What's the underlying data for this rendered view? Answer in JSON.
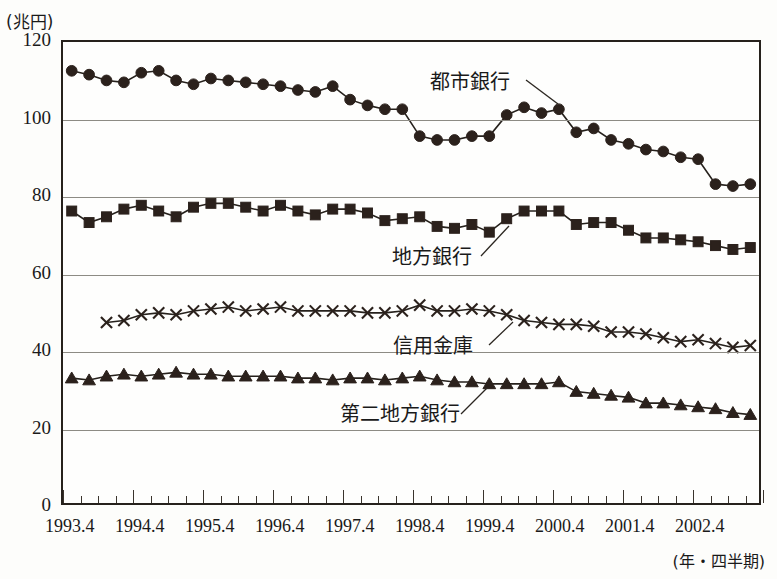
{
  "axes": {
    "y_unit_label": "(兆円)",
    "x_unit_label": "(年・四半期)",
    "y_ticks": [
      "0",
      "20",
      "40",
      "60",
      "80",
      "100",
      "120"
    ],
    "x_ticks": [
      "1993.4",
      "1994.4",
      "1995.4",
      "1996.4",
      "1997.4",
      "1998.4",
      "1999.4",
      "2000.4",
      "2001.4",
      "2002.4"
    ]
  },
  "annotations": {
    "city": "都市銀行",
    "regional": "地方銀行",
    "shinkin": "信用金庫",
    "second_regional": "第二地方銀行"
  },
  "colors": {
    "ink": "#26211c",
    "grid": "#8d8b84",
    "background": "#fdfdfb"
  },
  "chart_data": {
    "type": "line",
    "title": "",
    "xlabel": "(年・四半期)",
    "ylabel": "(兆円)",
    "ylim": [
      0,
      120
    ],
    "grid": true,
    "legend": "inline-annotations",
    "x": [
      "1993.4",
      "1993.7",
      "1993.10",
      "1994.1",
      "1994.4",
      "1994.7",
      "1994.10",
      "1995.1",
      "1995.4",
      "1995.7",
      "1995.10",
      "1996.1",
      "1996.4",
      "1996.7",
      "1996.10",
      "1997.1",
      "1997.4",
      "1997.7",
      "1997.10",
      "1998.1",
      "1998.4",
      "1998.7",
      "1998.10",
      "1999.1",
      "1999.4",
      "1999.7",
      "1999.10",
      "2000.1",
      "2000.4",
      "2000.7",
      "2000.10",
      "2001.1",
      "2001.4",
      "2001.7",
      "2001.10",
      "2002.1",
      "2002.4",
      "2002.7",
      "2002.10",
      "2003.1"
    ],
    "series": [
      {
        "name": "都市銀行",
        "marker": "circle",
        "values": [
          112.5,
          111.5,
          110.0,
          109.5,
          112.0,
          112.5,
          110.0,
          109.0,
          110.5,
          110.0,
          109.5,
          109.0,
          108.5,
          107.5,
          107.0,
          108.5,
          105.0,
          103.5,
          102.5,
          102.5,
          95.5,
          94.5,
          94.5,
          95.5,
          95.5,
          101.0,
          103.0,
          101.5,
          102.5,
          96.5,
          97.5,
          94.5,
          93.5,
          92.0,
          91.5,
          90.0,
          89.5,
          83.0,
          82.5,
          83.0
        ]
      },
      {
        "name": "地方銀行",
        "marker": "square",
        "values": [
          76.0,
          73.0,
          74.5,
          76.5,
          77.5,
          76.0,
          74.5,
          77.0,
          78.0,
          78.0,
          77.0,
          76.0,
          77.5,
          76.0,
          75.0,
          76.5,
          76.5,
          75.5,
          73.5,
          74.0,
          74.5,
          72.0,
          71.5,
          72.5,
          70.5,
          74.0,
          76.0,
          76.0,
          76.0,
          72.5,
          73.0,
          73.0,
          71.0,
          69.0,
          69.0,
          68.5,
          68.0,
          67.0,
          66.0,
          66.5
        ]
      },
      {
        "name": "信用金庫",
        "marker": "cross",
        "values": [
          null,
          null,
          47.0,
          47.5,
          49.0,
          49.5,
          49.0,
          50.0,
          50.5,
          51.0,
          50.0,
          50.5,
          51.0,
          50.0,
          50.0,
          50.0,
          50.0,
          49.5,
          49.5,
          50.0,
          51.5,
          50.0,
          50.0,
          50.5,
          50.0,
          49.0,
          47.5,
          47.0,
          46.5,
          46.5,
          46.0,
          44.5,
          44.5,
          44.0,
          43.0,
          42.0,
          42.5,
          41.5,
          40.5,
          41.0
        ]
      },
      {
        "name": "第二地方銀行",
        "marker": "triangle",
        "values": [
          32.5,
          32.0,
          33.0,
          33.5,
          33.0,
          33.5,
          34.0,
          33.5,
          33.5,
          33.0,
          33.0,
          33.0,
          33.0,
          32.5,
          32.5,
          32.0,
          32.5,
          32.5,
          32.0,
          32.5,
          33.0,
          32.0,
          31.5,
          31.5,
          31.0,
          31.0,
          31.0,
          31.0,
          31.5,
          29.0,
          28.5,
          28.0,
          27.5,
          26.0,
          26.0,
          25.5,
          25.0,
          24.5,
          23.5,
          23.0
        ]
      }
    ]
  }
}
